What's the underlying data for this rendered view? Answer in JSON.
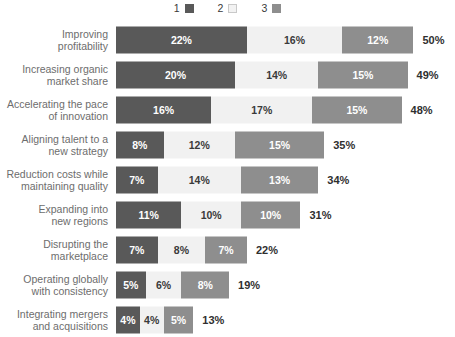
{
  "legend": {
    "items": [
      {
        "label": "1",
        "icon": "square-filled-dark-icon",
        "color": "#595959"
      },
      {
        "label": "2",
        "icon": "square-outline-light-icon",
        "color": "#f2f2f2"
      },
      {
        "label": "3",
        "icon": "square-filled-medium-icon",
        "color": "#8e8e8e"
      }
    ]
  },
  "colors": {
    "series1": "#595959",
    "series2": "#f1f1f1",
    "series3": "#8e8e8e",
    "category_label": "#6d6d6d",
    "total_label": "#2f2f2f",
    "background": "#ffffff"
  },
  "chart_data": {
    "type": "bar",
    "subtype": "stacked-horizontal",
    "title": "",
    "subtitle": "",
    "xlabel": "",
    "ylabel": "",
    "grid": false,
    "legend_position": "top-center",
    "xlim": [
      0,
      50
    ],
    "unit": "%",
    "categories": [
      "Improving\nprofitability",
      "Increasing organic\nmarket share",
      "Accelerating the pace\nof innovation",
      "Aligning talent to a\nnew strategy",
      "Reduction costs while\nmaintaining quality",
      "Expanding into\nnew regions",
      "Disrupting the\nmarketplace",
      "Operating globally\nwith consistency",
      "Integrating mergers\nand acquisitions"
    ],
    "series": [
      {
        "name": "1",
        "values": [
          22,
          20,
          16,
          8,
          7,
          11,
          7,
          5,
          4
        ]
      },
      {
        "name": "2",
        "values": [
          16,
          14,
          17,
          12,
          14,
          10,
          8,
          6,
          4
        ]
      },
      {
        "name": "3",
        "values": [
          12,
          15,
          15,
          15,
          13,
          10,
          7,
          8,
          5
        ]
      }
    ],
    "totals": [
      50,
      49,
      48,
      35,
      34,
      31,
      22,
      19,
      13
    ]
  },
  "rows": [
    {
      "category": "Improving\nprofitability",
      "segments": [
        {
          "series": "1",
          "value": 22,
          "label": "22%"
        },
        {
          "series": "2",
          "value": 16,
          "label": "16%"
        },
        {
          "series": "3",
          "value": 12,
          "label": "12%"
        }
      ],
      "total": 50,
      "total_label": "50%"
    },
    {
      "category": "Increasing organic\nmarket share",
      "segments": [
        {
          "series": "1",
          "value": 20,
          "label": "20%"
        },
        {
          "series": "2",
          "value": 14,
          "label": "14%"
        },
        {
          "series": "3",
          "value": 15,
          "label": "15%"
        }
      ],
      "total": 49,
      "total_label": "49%"
    },
    {
      "category": "Accelerating the pace\nof innovation",
      "segments": [
        {
          "series": "1",
          "value": 16,
          "label": "16%"
        },
        {
          "series": "2",
          "value": 17,
          "label": "17%"
        },
        {
          "series": "3",
          "value": 15,
          "label": "15%"
        }
      ],
      "total": 48,
      "total_label": "48%"
    },
    {
      "category": "Aligning talent to a\nnew strategy",
      "segments": [
        {
          "series": "1",
          "value": 8,
          "label": "8%"
        },
        {
          "series": "2",
          "value": 12,
          "label": "12%"
        },
        {
          "series": "3",
          "value": 15,
          "label": "15%"
        }
      ],
      "total": 35,
      "total_label": "35%"
    },
    {
      "category": "Reduction costs while\nmaintaining quality",
      "segments": [
        {
          "series": "1",
          "value": 7,
          "label": "7%"
        },
        {
          "series": "2",
          "value": 14,
          "label": "14%"
        },
        {
          "series": "3",
          "value": 13,
          "label": "13%"
        }
      ],
      "total": 34,
      "total_label": "34%"
    },
    {
      "category": "Expanding into\nnew regions",
      "segments": [
        {
          "series": "1",
          "value": 11,
          "label": "11%"
        },
        {
          "series": "2",
          "value": 10,
          "label": "10%"
        },
        {
          "series": "3",
          "value": 10,
          "label": "10%"
        }
      ],
      "total": 31,
      "total_label": "31%"
    },
    {
      "category": "Disrupting the\nmarketplace",
      "segments": [
        {
          "series": "1",
          "value": 7,
          "label": "7%"
        },
        {
          "series": "2",
          "value": 8,
          "label": "8%"
        },
        {
          "series": "3",
          "value": 7,
          "label": "7%"
        }
      ],
      "total": 22,
      "total_label": "22%"
    },
    {
      "category": "Operating globally\nwith consistency",
      "segments": [
        {
          "series": "1",
          "value": 5,
          "label": "5%"
        },
        {
          "series": "2",
          "value": 6,
          "label": "6%"
        },
        {
          "series": "3",
          "value": 8,
          "label": "8%"
        }
      ],
      "total": 19,
      "total_label": "19%"
    },
    {
      "category": "Integrating mergers\nand acquisitions",
      "segments": [
        {
          "series": "1",
          "value": 4,
          "label": "4%"
        },
        {
          "series": "2",
          "value": 4,
          "label": "4%"
        },
        {
          "series": "3",
          "value": 5,
          "label": "5%"
        }
      ],
      "total": 13,
      "total_label": "13%"
    }
  ]
}
